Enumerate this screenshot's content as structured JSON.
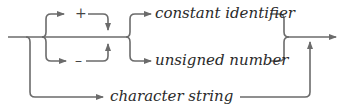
{
  "diagram": {
    "type": "syntax-diagram",
    "colors": {
      "line": "#6b6b6b",
      "text": "#2a2a2a"
    },
    "signs": {
      "plus": "+",
      "minus": "–"
    },
    "terms": {
      "constant_identifier": "constant identifier",
      "unsigned_number": "unsigned number",
      "character_string": "character string"
    }
  }
}
